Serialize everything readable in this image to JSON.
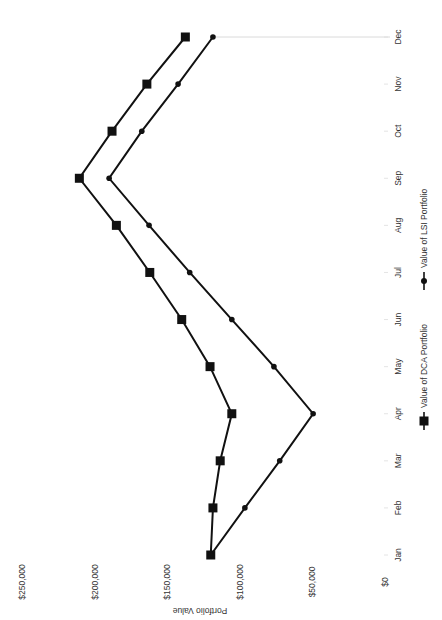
{
  "chart_data": {
    "type": "line",
    "title": "",
    "xlabel": "",
    "ylabel": "Portfolio Value",
    "categories": [
      "Jan",
      "Feb",
      "Mar",
      "Apr",
      "May",
      "Jun",
      "Jul",
      "Aug",
      "Sep",
      "Oct",
      "Nov",
      "Dec"
    ],
    "series": [
      {
        "name": "Value of DCA Portfolio",
        "marker": "square",
        "color": "#111111",
        "values": [
          120000,
          118500,
          113500,
          105500,
          120500,
          140000,
          162000,
          185000,
          210500,
          188000,
          164000,
          137500
        ]
      },
      {
        "name": "Value of LSI Portfolio",
        "marker": "circle",
        "color": "#111111",
        "values": [
          120000,
          96500,
          72500,
          49500,
          76500,
          105500,
          134500,
          162500,
          190000,
          167500,
          142500,
          118500
        ]
      }
    ],
    "ylim": [
      0,
      250000
    ],
    "yticks": [
      0,
      50000,
      100000,
      150000,
      200000,
      250000
    ],
    "ytick_labels": [
      "$0",
      "$50,000",
      "$100,000",
      "$150,000",
      "$200,000",
      "$250,000"
    ],
    "grid": false,
    "legend_position": "bottom",
    "orientation": "rotated-90"
  },
  "axis": {
    "ylabel": "Portfolio Value"
  },
  "legend": {
    "dca_label": "Value of DCA Portfolio",
    "lsi_label": "Value of LSI Portfolio"
  }
}
